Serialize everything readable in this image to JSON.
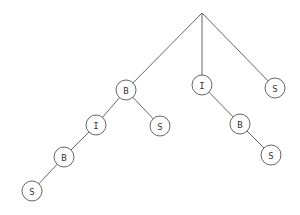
{
  "diagram": {
    "type": "tree",
    "root": {
      "id": "root",
      "x": 202,
      "y": 13,
      "label": ""
    },
    "node_radius": 10,
    "nodes": [
      {
        "id": "n1",
        "label": "B",
        "x": 126,
        "y": 90,
        "parent": "root"
      },
      {
        "id": "n2",
        "label": "I",
        "x": 202,
        "y": 85,
        "parent": "root"
      },
      {
        "id": "n3",
        "label": "S",
        "x": 275,
        "y": 88,
        "parent": "root"
      },
      {
        "id": "n4",
        "label": "I",
        "x": 96,
        "y": 125,
        "parent": "n1"
      },
      {
        "id": "n5",
        "label": "S",
        "x": 160,
        "y": 126,
        "parent": "n1"
      },
      {
        "id": "n6",
        "label": "B",
        "x": 240,
        "y": 124,
        "parent": "n2"
      },
      {
        "id": "n7",
        "label": "B",
        "x": 64,
        "y": 157,
        "parent": "n4"
      },
      {
        "id": "n8",
        "label": "S",
        "x": 271,
        "y": 155,
        "parent": "n6"
      },
      {
        "id": "n9",
        "label": "S",
        "x": 32,
        "y": 191,
        "parent": "n7"
      }
    ],
    "colors": {
      "stroke": "#555555",
      "text": "#333333",
      "background": "#ffffff"
    }
  }
}
